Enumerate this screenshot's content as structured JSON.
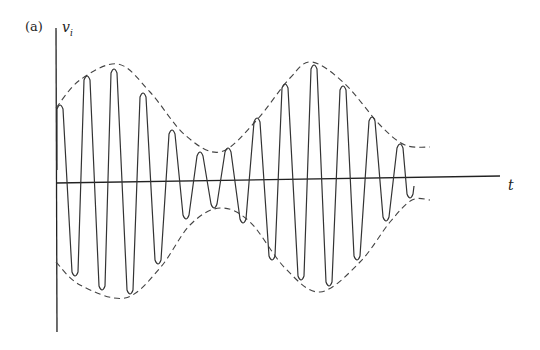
{
  "figure": {
    "panel_label": "(a)",
    "y_axis_label": "v",
    "y_axis_subscript": "i",
    "x_axis_label": "t",
    "colors": {
      "waveform": "#333333",
      "envelope": "#444444",
      "axes": "#222222",
      "background": "#ffffff"
    }
  },
  "chart_data": {
    "type": "line",
    "title": "",
    "xlabel": "t",
    "ylabel": "v_i",
    "grid": false,
    "legend": "none",
    "axes_px": {
      "y_axis": {
        "x": 56,
        "y_top": 28,
        "y_bottom": 332
      },
      "x_axis": {
        "x_start": 56,
        "y_start": 183,
        "x_end": 500,
        "y_end": 176
      }
    },
    "carrier_peaks_px": {
      "tops": [
        [
          60,
          103
        ],
        [
          87,
          74
        ],
        [
          114,
          67
        ],
        [
          143,
          91
        ],
        [
          172,
          128
        ],
        [
          200,
          150
        ],
        [
          228,
          146
        ],
        [
          257,
          116
        ],
        [
          285,
          82
        ],
        [
          314,
          63
        ],
        [
          343,
          84
        ],
        [
          372,
          115
        ],
        [
          400,
          142
        ]
      ],
      "bottoms": [
        [
          75,
          278
        ],
        [
          102,
          292
        ],
        [
          130,
          296
        ],
        [
          158,
          266
        ],
        [
          186,
          221
        ],
        [
          214,
          210
        ],
        [
          243,
          225
        ],
        [
          272,
          262
        ],
        [
          301,
          282
        ],
        [
          329,
          288
        ],
        [
          357,
          262
        ],
        [
          386,
          223
        ],
        [
          410,
          200
        ]
      ]
    },
    "envelope_upper_px": [
      [
        56,
        108
      ],
      [
        80,
        80
      ],
      [
        118,
        64
      ],
      [
        150,
        92
      ],
      [
        185,
        135
      ],
      [
        220,
        152
      ],
      [
        255,
        122
      ],
      [
        290,
        78
      ],
      [
        312,
        62
      ],
      [
        345,
        84
      ],
      [
        380,
        125
      ],
      [
        405,
        145
      ],
      [
        430,
        147
      ]
    ],
    "envelope_lower_px": [
      [
        56,
        262
      ],
      [
        80,
        285
      ],
      [
        125,
        298
      ],
      [
        160,
        268
      ],
      [
        190,
        225
      ],
      [
        220,
        208
      ],
      [
        250,
        222
      ],
      [
        285,
        268
      ],
      [
        320,
        292
      ],
      [
        360,
        262
      ],
      [
        390,
        222
      ],
      [
        412,
        200
      ],
      [
        430,
        200
      ]
    ],
    "series": [
      {
        "name": "carrier",
        "style": "solid"
      },
      {
        "name": "envelope",
        "style": "dashed"
      }
    ]
  }
}
